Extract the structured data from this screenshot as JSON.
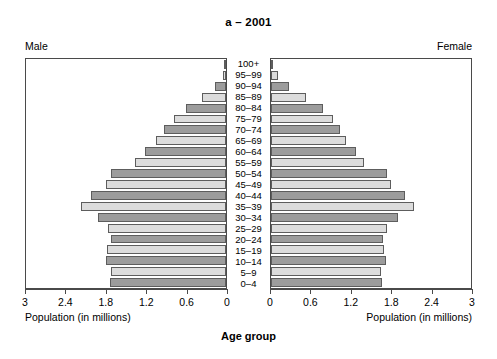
{
  "title": "a – 2001",
  "side_labels": {
    "left": "Male",
    "right": "Female"
  },
  "axis_caption": "Population (in millions)",
  "axis_title": "Age group",
  "colors": {
    "bar_dark": "#9c9c9c",
    "bar_light": "#dcdcdc",
    "outline": "#5d5d5d",
    "frame": "#4a4a4a"
  },
  "chart_data": {
    "type": "bar",
    "subtype": "population-pyramid",
    "title": "a – 2001",
    "xlabel": "Population (in millions)",
    "ylabel": "Age group",
    "grid": false,
    "legend": "none",
    "xlim": [
      0,
      3
    ],
    "xticks": [
      3,
      2.4,
      1.8,
      1.2,
      0.6,
      0
    ],
    "xticks_right": [
      0,
      0.6,
      1.2,
      1.8,
      2.4,
      3
    ],
    "categories": [
      "100+",
      "95–99",
      "90–94",
      "85–89",
      "80–84",
      "75–79",
      "70–74",
      "65–69",
      "60–64",
      "55–59",
      "50–54",
      "45–49",
      "40–44",
      "35–39",
      "30–34",
      "25–29",
      "20–24",
      "15–19",
      "10–14",
      "5–9",
      "0–4"
    ],
    "series": [
      {
        "name": "Male",
        "side": "left",
        "values": [
          0.01,
          0.05,
          0.16,
          0.36,
          0.6,
          0.78,
          0.93,
          1.05,
          1.22,
          1.36,
          1.72,
          1.8,
          2.02,
          2.17,
          1.92,
          1.77,
          1.73,
          1.78,
          1.8,
          1.73,
          1.74
        ]
      },
      {
        "name": "Female",
        "side": "right",
        "values": [
          0.03,
          0.1,
          0.27,
          0.52,
          0.78,
          0.93,
          1.04,
          1.13,
          1.28,
          1.4,
          1.74,
          1.8,
          2.01,
          2.15,
          1.9,
          1.74,
          1.68,
          1.7,
          1.72,
          1.65,
          1.66
        ]
      }
    ],
    "bar_shades": [
      "dark",
      "light",
      "dark",
      "light",
      "dark",
      "light",
      "dark",
      "light",
      "dark",
      "light",
      "dark",
      "light",
      "dark",
      "light",
      "dark",
      "light",
      "dark",
      "light",
      "dark",
      "light",
      "dark"
    ]
  }
}
